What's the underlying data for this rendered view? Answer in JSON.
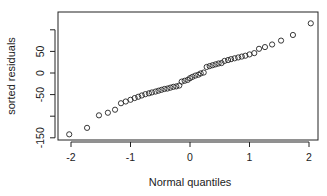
{
  "chart_data": {
    "type": "scatter",
    "title": "",
    "xlabel": "Normal quantiles",
    "ylabel": "sorted residuals",
    "xlim": [
      -2.2,
      2.2
    ],
    "ylim": [
      -150,
      140
    ],
    "x_ticks": [
      -2,
      -1,
      0,
      1,
      2
    ],
    "x_tick_labels": [
      "-2",
      "-1",
      "0",
      "1",
      "2"
    ],
    "y_ticks": [
      -150,
      -100,
      -50,
      0,
      50,
      100
    ],
    "y_tick_labels": [
      "-150",
      "",
      "-50",
      "0",
      "50",
      ""
    ],
    "grid": false,
    "legend": null,
    "marker": "open-circle",
    "x": [
      -2.03,
      -1.73,
      -1.53,
      -1.38,
      -1.26,
      -1.16,
      -1.08,
      -1.0,
      -0.93,
      -0.87,
      -0.81,
      -0.75,
      -0.69,
      -0.64,
      -0.58,
      -0.53,
      -0.48,
      -0.43,
      -0.38,
      -0.33,
      -0.28,
      -0.23,
      -0.18,
      -0.14,
      -0.09,
      -0.04,
      0.0,
      0.04,
      0.09,
      0.14,
      0.18,
      0.23,
      0.28,
      0.33,
      0.38,
      0.43,
      0.48,
      0.53,
      0.58,
      0.64,
      0.69,
      0.75,
      0.81,
      0.87,
      0.93,
      1.0,
      1.08,
      1.16,
      1.26,
      1.38,
      1.53,
      1.73,
      2.03
    ],
    "y": [
      -142,
      -127,
      -98,
      -92,
      -85,
      -70,
      -66,
      -62,
      -58,
      -55,
      -52,
      -49,
      -47,
      -45,
      -43,
      -41,
      -39,
      -37,
      -36,
      -34,
      -32,
      -31,
      -29,
      -20,
      -18,
      -16,
      -12,
      -9,
      -6,
      -4,
      -1,
      1,
      14,
      16,
      18,
      20,
      22,
      23,
      28,
      30,
      32,
      34,
      36,
      38,
      40,
      43,
      46,
      56,
      60,
      66,
      75,
      88,
      115
    ]
  }
}
